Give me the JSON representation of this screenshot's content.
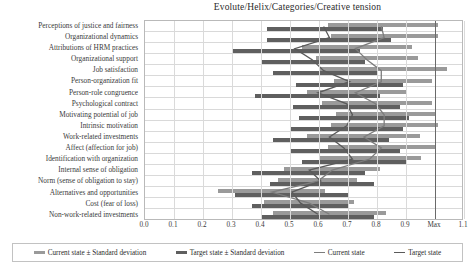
{
  "chart_data": {
    "type": "bar",
    "title": "Evolute/Helix/Categories/Creative tension",
    "xlabel": "",
    "ylabel": "",
    "xlim": [
      0.0,
      1.1
    ],
    "grid": true,
    "legend_position": "bottom",
    "xticks": [
      "0.0",
      "0.1",
      "0.2",
      "0.3",
      "0.4",
      "0.5",
      "0.6",
      "0.7",
      "0.8",
      "0.9",
      "Max",
      "1.1"
    ],
    "xtick_values": [
      0.0,
      0.1,
      0.2,
      0.3,
      0.4,
      0.5,
      0.6,
      0.7,
      0.8,
      0.9,
      1.0,
      1.1
    ],
    "max_marker_label": "Max",
    "max_marker_value": 1.0,
    "categories": [
      "Perceptions of justice and fairness",
      "Organizational dynamics",
      "Attributions of HRM practices",
      "Organizational support",
      "Job satisfaction",
      "Person-organization fit",
      "Person-role congruence",
      "Psychological contract",
      "Motivating potential of job",
      "Intrinsic motivation",
      "Work-related investments",
      "Affect (affection for job)",
      "Identification with organization",
      "Internal sense of obligation",
      "Norm (sense of obligation to stay)",
      "Alternatives and opportunities",
      "Cost (fear of loss)",
      "Non-work-related investments"
    ],
    "series": [
      {
        "name": "Current state ± Standard deviation",
        "type": "range_bar",
        "color": "#9a9a9a",
        "ranges": [
          [
            0.63,
            1.01
          ],
          [
            0.64,
            1.01
          ],
          [
            0.54,
            0.92
          ],
          [
            0.59,
            0.94
          ],
          [
            0.6,
            1.04
          ],
          [
            0.65,
            0.99
          ],
          [
            0.56,
            0.9
          ],
          [
            0.61,
            0.99
          ],
          [
            0.66,
            1.0
          ],
          [
            0.64,
            1.01
          ],
          [
            0.56,
            0.95
          ],
          [
            0.63,
            1.0
          ],
          [
            0.6,
            0.95
          ],
          [
            0.48,
            0.81
          ],
          [
            0.46,
            0.73
          ],
          [
            0.25,
            0.62
          ],
          [
            0.41,
            0.72
          ],
          [
            0.44,
            0.83
          ]
        ]
      },
      {
        "name": "Target state ± Standard deviation",
        "type": "range_bar",
        "color": "#5f5f5f",
        "ranges": [
          [
            0.42,
            0.82
          ],
          [
            0.42,
            0.85
          ],
          [
            0.3,
            0.74
          ],
          [
            0.4,
            0.76
          ],
          [
            0.44,
            0.8
          ],
          [
            0.52,
            0.89
          ],
          [
            0.38,
            0.81
          ],
          [
            0.51,
            0.88
          ],
          [
            0.53,
            0.91
          ],
          [
            0.5,
            0.89
          ],
          [
            0.44,
            0.84
          ],
          [
            0.5,
            0.88
          ],
          [
            0.54,
            0.9
          ],
          [
            0.37,
            0.76
          ],
          [
            0.43,
            0.79
          ],
          [
            0.31,
            0.7
          ],
          [
            0.37,
            0.7
          ],
          [
            0.4,
            0.79
          ]
        ]
      },
      {
        "name": "Current state",
        "type": "line",
        "color": "#7d7d7d",
        "values": [
          0.82,
          0.83,
          0.73,
          0.77,
          0.82,
          0.82,
          0.73,
          0.8,
          0.83,
          0.83,
          0.76,
          0.82,
          0.78,
          0.65,
          0.6,
          0.44,
          0.57,
          0.64
        ]
      },
      {
        "name": "Target state",
        "type": "line",
        "color": "#5a5a5a",
        "values": [
          0.62,
          0.64,
          0.52,
          0.58,
          0.62,
          0.71,
          0.6,
          0.7,
          0.72,
          0.7,
          0.64,
          0.69,
          0.72,
          0.57,
          0.61,
          0.51,
          0.54,
          0.6
        ]
      }
    ]
  },
  "legend": {
    "items": [
      "Current state ± Standard deviation",
      "Target state ± Standard deviation",
      "Current state",
      "Target state"
    ]
  }
}
